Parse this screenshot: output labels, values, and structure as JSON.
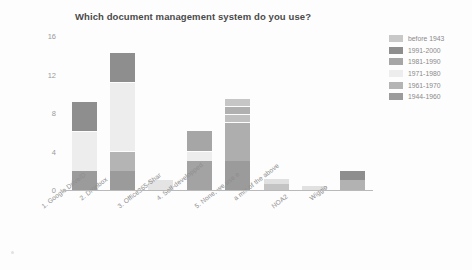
{
  "chart_data": {
    "type": "bar",
    "subtype": "stacked-vertical",
    "title": "Which document management system do you use?",
    "xlabel": "",
    "ylabel": "",
    "ylim": [
      0,
      16
    ],
    "yticks": [
      0,
      4,
      8,
      12,
      16
    ],
    "grid": false,
    "legend_position": "right",
    "categories": [
      "1. Google Drive/D",
      "2. Dropbox",
      "3. Office365-Shar",
      "4. Self-developped",
      "5. None, we use e",
      "a mix of the above",
      "NOA2",
      "Wiggio"
    ],
    "series": [
      {
        "name": "before 1943",
        "color": "#c8c8c8",
        "values": [
          0,
          0,
          1.0,
          0,
          0.7,
          0.5,
          0.4,
          0
        ]
      },
      {
        "name": "1991-2000",
        "color": "#8e8e8e",
        "values": [
          3.0,
          3.0,
          0,
          0,
          0.7,
          0,
          0,
          1.0
        ]
      },
      {
        "name": "1981-1990",
        "color": "#a6a6a6",
        "values": [
          0,
          0,
          0,
          2.0,
          0.7,
          0,
          0,
          0
        ]
      },
      {
        "name": "1971-1980",
        "color": "#ededed",
        "values": [
          4.0,
          7.0,
          0,
          1.0,
          0,
          0,
          0,
          0
        ]
      },
      {
        "name": "1961-1970",
        "color": "#b4b4b4",
        "values": [
          0,
          2.0,
          0,
          0,
          4.0,
          0,
          0,
          0
        ]
      },
      {
        "name": "1944-1960",
        "color": "#9b9b9b",
        "values": [
          2.0,
          2.0,
          0,
          3.0,
          3.0,
          0.6,
          0,
          1.0
        ]
      }
    ],
    "bar_totals": [
      9,
      14,
      1,
      6,
      9.1,
      1.1,
      0.4,
      2
    ],
    "legend": [
      {
        "label": "before 1943",
        "color": "#c8c8c8"
      },
      {
        "label": "1991-2000",
        "color": "#8e8e8e"
      },
      {
        "label": "1981-1990",
        "color": "#a6a6a6"
      },
      {
        "label": "1971-1980",
        "color": "#ededed"
      },
      {
        "label": "1961-1970",
        "color": "#b4b4b4"
      },
      {
        "label": "1944-1960",
        "color": "#9b9b9b"
      }
    ],
    "bars": [
      {
        "category": "1. Google Drive/D",
        "total": 9,
        "segments": [
          {
            "series": "1944-1960",
            "value": 2.0,
            "color": "#9b9b9b"
          },
          {
            "series": "1971-1980",
            "value": 4.0,
            "color": "#ededed"
          },
          {
            "series": "1991-2000",
            "value": 3.0,
            "color": "#8e8e8e"
          }
        ]
      },
      {
        "category": "2. Dropbox",
        "total": 14,
        "segments": [
          {
            "series": "1944-1960",
            "value": 2.0,
            "color": "#9b9b9b"
          },
          {
            "series": "1961-1970",
            "value": 2.0,
            "color": "#b4b4b4"
          },
          {
            "series": "1971-1980",
            "value": 7.0,
            "color": "#ededed"
          },
          {
            "series": "1991-2000",
            "value": 3.0,
            "color": "#8e8e8e"
          }
        ]
      },
      {
        "category": "3. Office365-Shar",
        "total": 1,
        "segments": [
          {
            "series": "before 1943",
            "value": 1.0,
            "color": "#e4e4e4"
          }
        ]
      },
      {
        "category": "4. Self-developped",
        "total": 6,
        "segments": [
          {
            "series": "1944-1960",
            "value": 3.0,
            "color": "#a3a3a3"
          },
          {
            "series": "1971-1980",
            "value": 1.0,
            "color": "#ededed"
          },
          {
            "series": "1981-1990",
            "value": 2.0,
            "color": "#a6a6a6"
          }
        ]
      },
      {
        "category": "5. None, we use e",
        "total": 9.1,
        "segments": [
          {
            "series": "1944-1960",
            "value": 3.0,
            "color": "#9b9b9b"
          },
          {
            "series": "1961-1970",
            "value": 4.0,
            "color": "#aeaeae"
          },
          {
            "series": "1981-1990",
            "value": 0.7,
            "color": "#c0c0c0"
          },
          {
            "series": "1991-2000",
            "value": 0.7,
            "color": "#b0b0b0"
          },
          {
            "series": "before 1943",
            "value": 0.7,
            "color": "#c6c6c6"
          }
        ]
      },
      {
        "category": "a mix of the above",
        "total": 1.1,
        "segments": [
          {
            "series": "1944-1960",
            "value": 0.6,
            "color": "#c4c4c4"
          },
          {
            "series": "before 1943",
            "value": 0.5,
            "color": "#e0e0e0"
          }
        ]
      },
      {
        "category": "NOA2",
        "total": 0.4,
        "segments": [
          {
            "series": "before 1943",
            "value": 0.4,
            "color": "#e1e1e1"
          }
        ]
      },
      {
        "category": "Wiggio",
        "total": 2,
        "segments": [
          {
            "series": "1944-1960",
            "value": 1.0,
            "color": "#b2b2b2"
          },
          {
            "series": "1991-2000",
            "value": 1.0,
            "color": "#8e8e8e"
          }
        ]
      }
    ]
  },
  "axis": {
    "y_tick_labels": [
      "16",
      "12",
      "8",
      "4",
      "0"
    ]
  }
}
